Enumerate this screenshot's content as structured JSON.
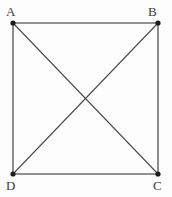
{
  "figure": {
    "type": "geometry-diagram",
    "background_color": "#fdfdfd",
    "edge_color": "#6f6f6f",
    "diagonal_color": "#4a4a4a",
    "vertex_color": "#1c1c1c",
    "label_color": "#3a3a3a",
    "edge_width": 1.6,
    "diagonal_width": 1.1,
    "vertex_radius": 2.6,
    "vertices": [
      {
        "id": "A",
        "label": "A",
        "x": 13,
        "y": 23,
        "label_x": 6,
        "label_y": 5
      },
      {
        "id": "B",
        "label": "B",
        "x": 158,
        "y": 23,
        "label_x": 148,
        "label_y": 5
      },
      {
        "id": "C",
        "label": "C",
        "x": 158,
        "y": 174,
        "label_x": 153,
        "label_y": 179
      },
      {
        "id": "D",
        "label": "D",
        "x": 13,
        "y": 174,
        "label_x": 6,
        "label_y": 179
      }
    ],
    "edges": [
      {
        "name": "edge-ab",
        "from": "A",
        "to": "B"
      },
      {
        "name": "edge-bc",
        "from": "B",
        "to": "C"
      },
      {
        "name": "edge-cd",
        "from": "C",
        "to": "D"
      },
      {
        "name": "edge-da",
        "from": "D",
        "to": "A"
      }
    ],
    "diagonals": [
      {
        "name": "diagonal-ac",
        "from": "A",
        "to": "C"
      },
      {
        "name": "diagonal-bd",
        "from": "B",
        "to": "D"
      }
    ],
    "intersection": {
      "name": "diagonal-intersection",
      "x": 85.5,
      "y": 98.5
    }
  }
}
